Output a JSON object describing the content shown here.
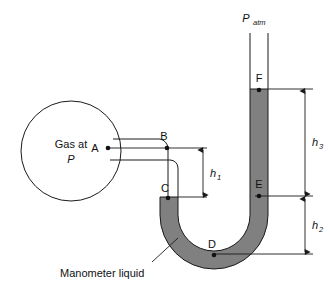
{
  "figure": {
    "type": "physics-schematic"
  },
  "colors": {
    "liquid_fill": "#808080",
    "outline": "#1a1a1a",
    "background": "#ffffff",
    "text": "#111111"
  },
  "labels": {
    "gas_line1": "Gas at",
    "gas_line2": "P",
    "p_atm_main": "P",
    "p_atm_sub": "atm",
    "point_a": "A",
    "point_b": "B",
    "point_c": "C",
    "point_d": "D",
    "point_e": "E",
    "point_f": "F",
    "h1_main": "h",
    "h1_sub": "1",
    "h2_main": "h",
    "h2_sub": "2",
    "h3_main": "h",
    "h3_sub": "3",
    "callout": "Manometer liquid"
  },
  "geometry": {
    "bulb_center_x": 71,
    "bulb_center_y": 151,
    "bulb_radius": 50,
    "level_f_y": 89,
    "level_e_y": 196,
    "level_d_y": 254,
    "level_b_y": 148,
    "level_c_y": 197
  }
}
